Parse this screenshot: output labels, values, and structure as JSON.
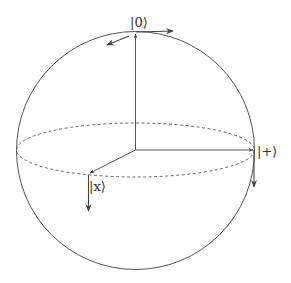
{
  "diagram": {
    "type": "bloch-sphere",
    "labels": {
      "top": "|0⟩",
      "right": "|+⟩",
      "front": "|x⟩"
    },
    "colors": {
      "stroke": "#444444",
      "background": "#ffffff"
    }
  }
}
